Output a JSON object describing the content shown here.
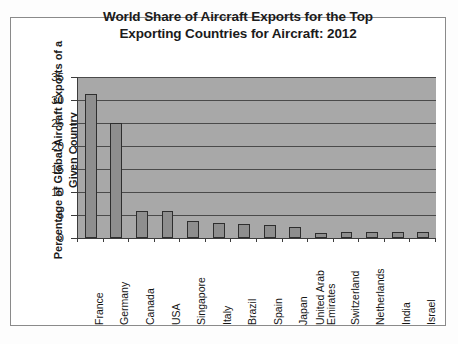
{
  "figure": {
    "title_lines": [
      "World Share of Aircraft Exports for the Top",
      "Exporting Countries for Aircraft: 2012"
    ],
    "ylabel_lines": [
      "Percentage of Global Aircraft Exports of a",
      "Given Country"
    ],
    "background_color": "#ffffff",
    "plot_background_color": "#a8a8a8",
    "bar_fill_color": "#8e8e8e",
    "bar_border_color": "#2e2e2e",
    "gridline_color": "#4a4a4a",
    "axis_color": "#3c3c3c"
  },
  "chart_data": {
    "type": "bar",
    "title": "World Share of Aircraft Exports for the Top Exporting Countries for Aircraft: 2012",
    "xlabel": "",
    "ylabel": "Percentage of Global Aircraft Exports of a Given Country",
    "categories": [
      "France",
      "Germany",
      "Canada",
      "USA",
      "Singapore",
      "Italy",
      "Brazil",
      "Spain",
      "Japan",
      "United Arab Emirates",
      "Switzerland",
      "Netherlands",
      "India",
      "Israel"
    ],
    "category_label_lines": [
      [
        "France"
      ],
      [
        "Germany"
      ],
      [
        "Canada"
      ],
      [
        "USA"
      ],
      [
        "Singapore"
      ],
      [
        "Italy"
      ],
      [
        "Brazil"
      ],
      [
        "Spain"
      ],
      [
        "Japan"
      ],
      [
        "United Arab",
        "Emirates"
      ],
      [
        "Switzerland"
      ],
      [
        "Netherlands"
      ],
      [
        "India"
      ],
      [
        "Israel"
      ]
    ],
    "values": [
      31.4,
      25.0,
      5.9,
      5.8,
      3.6,
      3.3,
      3.1,
      2.8,
      2.4,
      1.1,
      1.3,
      1.2,
      1.2,
      1.2
    ],
    "ylim": [
      0,
      35
    ],
    "yticks": [
      0,
      5,
      10,
      15,
      20,
      25,
      30,
      35
    ],
    "ytick_labels": [
      "0",
      "5",
      "10",
      "15",
      "20",
      "25",
      "30",
      "35"
    ],
    "grid": true,
    "grid_axis": "y",
    "legend": false
  }
}
